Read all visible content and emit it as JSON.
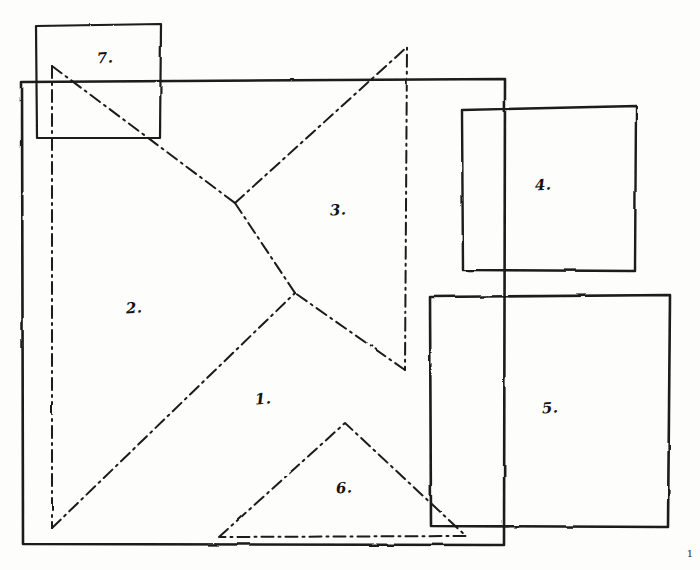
{
  "figure": {
    "medium": "hand-drawn pen on paper",
    "background_color": "#fdfdfb",
    "ink_color": "#1a1a1a",
    "width": 700,
    "height": 570
  },
  "labels": [
    {
      "id": "piece-1",
      "text": "1.",
      "x": 263,
      "y": 399
    },
    {
      "id": "piece-2",
      "text": "2.",
      "x": 134,
      "y": 308
    },
    {
      "id": "piece-3",
      "text": "3.",
      "x": 338,
      "y": 210
    },
    {
      "id": "piece-4",
      "text": "4.",
      "x": 543,
      "y": 185
    },
    {
      "id": "piece-5",
      "text": "5.",
      "x": 550,
      "y": 408
    },
    {
      "id": "piece-6",
      "text": "6.",
      "x": 344,
      "y": 488
    },
    {
      "id": "piece-7",
      "text": "7.",
      "x": 105,
      "y": 58
    }
  ],
  "corner_mark": {
    "text": "1",
    "x": 690,
    "y": 553
  },
  "solid_shapes": [
    {
      "id": "outer-frame",
      "name": "main-frame-rectangle",
      "stroke_width": 2.6,
      "points": "22,82 505,79 504,545 23,544"
    },
    {
      "id": "rect-7",
      "name": "rectangle-7",
      "stroke_width": 2.2,
      "points": "36,26 161,24 160,138 37,138"
    },
    {
      "id": "square-4",
      "name": "square-4",
      "stroke_width": 2.4,
      "points": "462,110 636,106 635,271 463,270"
    },
    {
      "id": "square-5",
      "name": "square-5",
      "stroke_width": 2.6,
      "points": "430,297 670,295 668,527 431,526"
    }
  ],
  "dashdot_shapes": [
    {
      "id": "tri-2",
      "name": "triangle-2-dashdot",
      "stroke_width": 2.0,
      "closed": false,
      "points": "52,66 52,528"
    },
    {
      "id": "tri-2-hyp",
      "name": "triangle-2-hypotenuse-dashdot",
      "stroke_width": 2.0,
      "closed": false,
      "points": "52,66 235,203"
    },
    {
      "id": "tri-2-base-diag",
      "name": "long-diagonal-dashdot",
      "stroke_width": 2.0,
      "closed": false,
      "points": "52,528 295,293"
    },
    {
      "id": "tri-3",
      "name": "triangle-3-dashdot",
      "stroke_width": 2.0,
      "closed": false,
      "points": "235,203 407,47 405,370"
    },
    {
      "id": "tri-3-return",
      "name": "triangle-3-lower-edge-dashdot",
      "stroke_width": 2.0,
      "closed": false,
      "points": "405,370 295,293"
    },
    {
      "id": "tri-1",
      "name": "triangle-1-edge-dashdot",
      "stroke_width": 2.0,
      "closed": false,
      "points": "235,203 295,293"
    },
    {
      "id": "tri-6",
      "name": "triangle-6-dashdot",
      "stroke_width": 2.0,
      "closed": true,
      "points": "219,537 345,423 466,536"
    }
  ],
  "geometry_notes": {
    "piece_count": 7,
    "frame_bounds": {
      "left": 22,
      "top": 79,
      "right": 505,
      "bottom": 545
    },
    "dash_pattern": "12 5 2 5"
  }
}
